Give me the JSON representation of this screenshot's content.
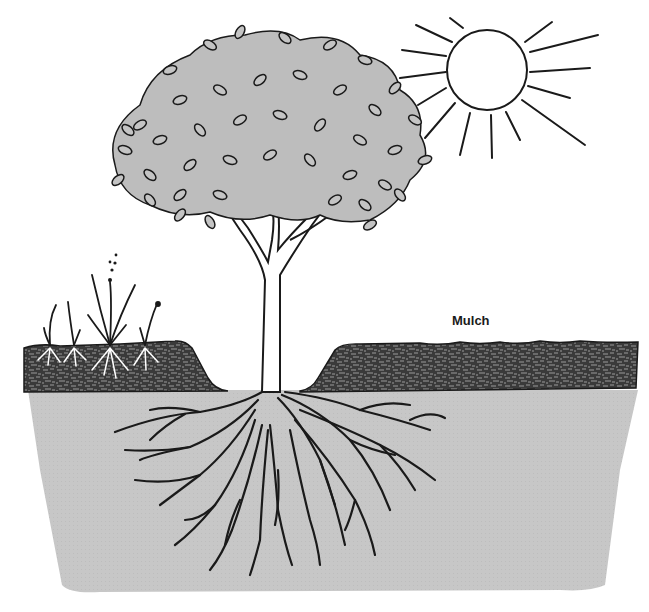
{
  "diagram": {
    "labels": [
      {
        "id": "mulch",
        "text": "Mulch",
        "x": 452,
        "y": 313
      }
    ],
    "elements": [
      {
        "name": "sun",
        "description": "Sun with radiating rays"
      },
      {
        "name": "tree-canopy",
        "description": "Leafy tree crown"
      },
      {
        "name": "tree-trunk",
        "description": "Trunk with branches"
      },
      {
        "name": "weeds",
        "description": "Small grass and weed plants with white roots in mulch, left side"
      },
      {
        "name": "mulch-layer",
        "description": "Dark textured mulch layer, pulled back from trunk"
      },
      {
        "name": "soil",
        "description": "Gray soil cross-section"
      },
      {
        "name": "root-system",
        "description": "Branching roots spreading beneath the tree"
      }
    ],
    "colors": {
      "background": "#ffffff",
      "ink": "#1a1a1a",
      "leaf_fill": "#bdbdbd",
      "mulch": "#3a3a3a",
      "soil": "#c7c7c7"
    }
  }
}
